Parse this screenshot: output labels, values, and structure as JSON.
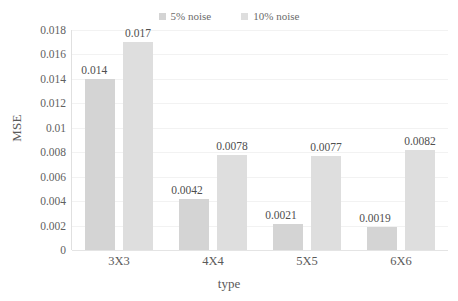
{
  "chart_data": {
    "type": "bar",
    "title": "",
    "xlabel": "type",
    "ylabel": "MSE",
    "categories": [
      "3X3",
      "4X4",
      "5X5",
      "6X6"
    ],
    "series": [
      {
        "name": "5% noise",
        "color": "#d4d4d4",
        "values": [
          0.014,
          0.0042,
          0.0021,
          0.0019
        ],
        "labels": [
          "0.014",
          "0.0042",
          "0.0021",
          "0.0019"
        ]
      },
      {
        "name": "10% noise",
        "color": "#dedede",
        "values": [
          0.017,
          0.0078,
          0.0077,
          0.0082
        ],
        "labels": [
          "0.017",
          "0.0078",
          "0.0077",
          "0.0082"
        ]
      }
    ],
    "ylim": [
      0,
      0.018
    ],
    "yticks": [
      0,
      0.002,
      0.004,
      0.006,
      0.008,
      0.01,
      0.012,
      0.014,
      0.016,
      0.018
    ],
    "ytick_labels": [
      "0",
      "0.002",
      "0.004",
      "0.006",
      "0.008",
      "0.01",
      "0.012",
      "0.014",
      "0.016",
      "0.018"
    ],
    "grid": true,
    "legend_position": "top-center"
  }
}
